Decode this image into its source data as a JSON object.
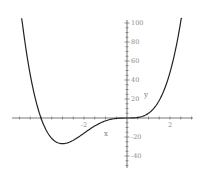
{
  "chart_data": {
    "type": "line",
    "title": "",
    "xlabel": "x",
    "ylabel": "y",
    "xlim": [
      -5.3,
      3.1
    ],
    "ylim": [
      -50,
      100
    ],
    "x_ticks": [
      {
        "value": -2,
        "label": "-2"
      },
      {
        "value": 2,
        "label": "2"
      }
    ],
    "y_ticks": [
      {
        "value": 100,
        "label": "100"
      },
      {
        "value": 80,
        "label": "80"
      },
      {
        "value": 60,
        "label": "60"
      },
      {
        "value": 40,
        "label": "40"
      },
      {
        "value": 20,
        "label": "20"
      },
      {
        "value": -20,
        "label": "-20"
      },
      {
        "value": -40,
        "label": "-40"
      }
    ],
    "grid": false,
    "legend": null,
    "series": [
      {
        "name": "y",
        "color": "#222222",
        "x": [
          -4.9,
          -4.5,
          -4.0,
          -3.5,
          -3.0,
          -2.5,
          -2.0,
          -1.5,
          -1.0,
          -0.5,
          0.0,
          0.5,
          1.0,
          1.5,
          2.0,
          2.56
        ],
        "y": [
          100,
          46,
          0,
          -21,
          -27,
          -23,
          -16,
          -8.4,
          -3,
          -0.4,
          0,
          0.6,
          5,
          18.6,
          48,
          110
        ]
      }
    ]
  },
  "plot": {
    "origin_px": [
      127,
      118
    ],
    "x_scale_px_per_unit": 21.5,
    "y_scale_px_per_unit": 0.95,
    "x_axis_px_range": [
      12,
      193
    ],
    "y_axis_px_range": [
      20,
      168
    ],
    "curve_color": "#222222",
    "axis_color": "#555555"
  }
}
